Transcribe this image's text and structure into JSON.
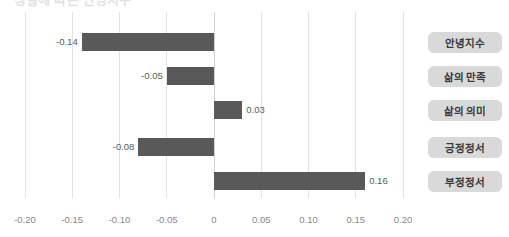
{
  "title": {
    "text": "성별에 따른 안녕지수",
    "visible_partially": true
  },
  "legend": {
    "items": [
      {
        "label": "안녕지수"
      },
      {
        "label": "삶의 만족"
      },
      {
        "label": "삶의 의미"
      },
      {
        "label": "긍정정서"
      },
      {
        "label": "부정정서"
      }
    ]
  },
  "axis": {
    "ticks": [
      {
        "label": "-0.20",
        "value": -0.2
      },
      {
        "label": "-0.15",
        "value": -0.15
      },
      {
        "label": "-0.10",
        "value": -0.1
      },
      {
        "label": "-0.05",
        "value": -0.05
      },
      {
        "label": "0",
        "value": 0
      },
      {
        "label": "0.05",
        "value": 0.05
      },
      {
        "label": "0.10",
        "value": 0.1
      },
      {
        "label": "0.15",
        "value": 0.15
      },
      {
        "label": "0.20",
        "value": 0.2
      }
    ]
  },
  "bars": [
    {
      "label": "안녕지수",
      "value": -0.14,
      "value_label": "-0.14"
    },
    {
      "label": "삶의 만족",
      "value": -0.05,
      "value_label": "-0.05"
    },
    {
      "label": "삶의 의미",
      "value": 0.03,
      "value_label": "0.03"
    },
    {
      "label": "긍정정서",
      "value": -0.08,
      "value_label": "-0.08"
    },
    {
      "label": "부정정서",
      "value": 0.16,
      "value_label": "0.16"
    }
  ],
  "colors": {
    "bar": "#595959",
    "pill_background": "#d9d9d9",
    "pill_text": "#3a3a3c",
    "gridline": "#e3e3e6",
    "zero_line": "#d4d4d7",
    "axis_text": "#87878c",
    "value_text": "#5b5b5f",
    "background": "#ffffff"
  },
  "chart_data": {
    "type": "bar",
    "orientation": "horizontal",
    "title": "성별에 따른 안녕지수",
    "categories": [
      "안녕지수",
      "삶의 만족",
      "삶의 의미",
      "긍정정서",
      "부정정서"
    ],
    "values": [
      -0.14,
      -0.05,
      0.03,
      -0.08,
      0.16
    ],
    "data_labels": [
      "-0.14",
      "-0.05",
      "0.03",
      "-0.08",
      "0.16"
    ],
    "xlabel": "",
    "ylabel": "",
    "xlim": [
      -0.2,
      0.2
    ],
    "xticks": [
      -0.2,
      -0.15,
      -0.1,
      -0.05,
      0,
      0.05,
      0.1,
      0.15,
      0.2
    ],
    "xticklabels": [
      "-0.20",
      "-0.15",
      "-0.10",
      "-0.05",
      "0",
      "0.05",
      "0.10",
      "0.15",
      "0.20"
    ],
    "grid": true,
    "grid_axis": "x",
    "legend": "right",
    "series": [
      {
        "name": "효과크기",
        "values": [
          -0.14,
          -0.05,
          0.03,
          -0.08,
          0.16
        ]
      }
    ]
  }
}
